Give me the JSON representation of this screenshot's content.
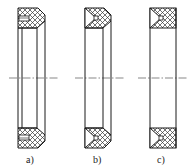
{
  "figure": {
    "type": "seal-ring cross sections",
    "panels": [
      {
        "id": "a",
        "label": "a)",
        "profile": "chamfered block with rectangular slot"
      },
      {
        "id": "b",
        "label": "b)",
        "profile": "chamfered block with V-groove and square core"
      },
      {
        "id": "c",
        "label": "c)",
        "profile": "rectangular block with V-groove and square core"
      }
    ],
    "centerline": "dash-dot axis",
    "hatch": "cross-hatch",
    "colors": {
      "line": "#1a1a1a",
      "background": "#ffffff"
    }
  }
}
